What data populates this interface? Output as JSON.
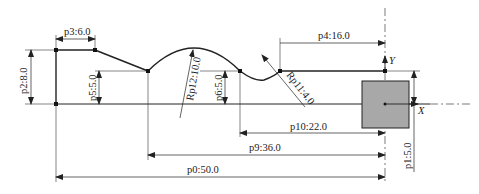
{
  "diagram": {
    "type": "cad-profile-dimension-drawing",
    "dimensions": {
      "p0": "p0:50.0",
      "p1": "p1:5.0",
      "p2": "p2:8.0",
      "p3": "p3:6.0",
      "p4": "p4:16.0",
      "p5": "p5:5.0",
      "p6": "p6:5.0",
      "p9": "p9:36.0",
      "p10": "p10:22.0",
      "rp11": "Rp11:4.0",
      "rp12": "Rp12:10.0"
    },
    "axes": {
      "x": "X",
      "y": "Y"
    },
    "colors": {
      "line": "#222222",
      "fill_square": "#a8a8a8"
    }
  }
}
